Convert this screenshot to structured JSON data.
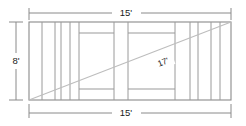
{
  "drawing": {
    "title": "deck-framing-plan",
    "description": "Rectangular deck framing plan with joists and diagonal brace dimension",
    "colors": {
      "frame_line": "#8a8a8a",
      "joist_line": "#9a9a9a",
      "diagonal_line": "#b5b5b5",
      "dimension_line": "#8a8a8a",
      "text": "#1a1a1a",
      "background": "#ffffff"
    },
    "dimensions": {
      "top": {
        "label": "15'",
        "value": 15,
        "unit": "feet",
        "orientation": "horizontal",
        "position": "top"
      },
      "left": {
        "label": "8'",
        "value": 8,
        "unit": "feet",
        "orientation": "vertical",
        "position": "left"
      },
      "bottom": {
        "label": "15'",
        "value": 15,
        "unit": "feet",
        "orientation": "horizontal",
        "position": "bottom"
      },
      "diagonal": {
        "label": "17'",
        "value": 17,
        "unit": "feet",
        "orientation": "diagonal",
        "position": "center"
      }
    },
    "geometry": {
      "outline": {
        "x": 29,
        "y": 22,
        "width": 202,
        "height": 78
      },
      "vertical_joists_x": [
        42,
        55,
        61,
        70,
        79,
        114,
        128,
        175,
        190,
        198,
        211,
        220
      ],
      "horizontal_rails": [
        {
          "x1": 79,
          "x2": 114,
          "y": 33
        },
        {
          "x1": 128,
          "x2": 175,
          "y": 33
        },
        {
          "x1": 79,
          "x2": 114,
          "y": 89
        },
        {
          "x1": 128,
          "x2": 175,
          "y": 89
        }
      ],
      "diagonal": {
        "x1": 29,
        "y1": 100,
        "x2": 231,
        "y2": 22
      }
    }
  }
}
